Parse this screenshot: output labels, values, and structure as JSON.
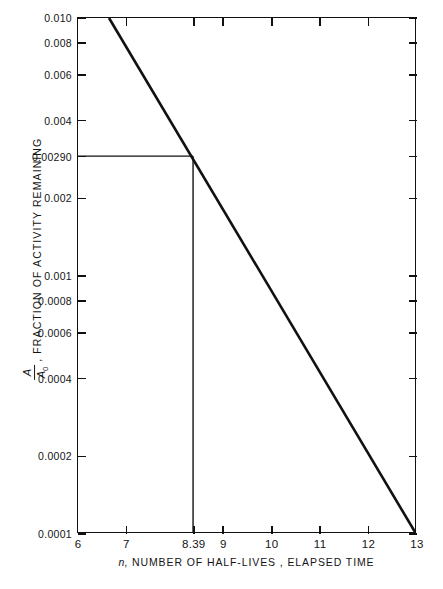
{
  "chart_data": {
    "type": "line",
    "title": "",
    "xlabel": "n , NUMBER OF HALF-LIVES , ELAPSED TIME",
    "xlabel_italic_symbol": "n",
    "xlabel_rest": ", NUMBER OF HALF-LIVES , ELAPSED TIME",
    "ylabel_prefix": "",
    "ylabel_rest": ", FRACTION OF ACTIVITY REMAINING",
    "ylabel_fraction_numerator": "A",
    "ylabel_fraction_denominator": "A",
    "ylabel_fraction_denominator_sub": "0",
    "yscale": "log",
    "xscale": "linear",
    "xlim": [
      6,
      13
    ],
    "ylim": [
      0.0001,
      0.01
    ],
    "grid": false,
    "legend": "none",
    "xticks": [
      6,
      7,
      8.39,
      9,
      10,
      11,
      12,
      13
    ],
    "xticklabels": [
      "6",
      "7",
      "8.39",
      "9",
      "10",
      "11",
      "12",
      "13"
    ],
    "yticks": [
      0.01,
      0.008,
      0.006,
      0.004,
      0.0029,
      0.002,
      0.001,
      0.0008,
      0.0006,
      0.0004,
      0.0002,
      0.0001
    ],
    "yticklabels": [
      "0.010",
      "0.008",
      "0.006",
      "0.004",
      "0.00290",
      "0.002",
      "0.001",
      "0.0008",
      "0.0006",
      "0.0004",
      "0.0002",
      "0.0001"
    ],
    "series": [
      {
        "name": "decay-curve",
        "x": [
          6.644,
          13.0
        ],
        "values": [
          0.01,
          0.0001
        ],
        "color": "#111111",
        "linewidth": 2.6
      }
    ],
    "annotations": [
      {
        "name": "readout-horizontal",
        "type": "horizontal-line",
        "y": 0.0029,
        "x_from": 6,
        "x_to": 8.39,
        "color": "#111111"
      },
      {
        "name": "readout-vertical",
        "type": "vertical-line",
        "x": 8.39,
        "y_from": 0.0001,
        "y_to": 0.0029,
        "color": "#111111"
      }
    ],
    "readout": {
      "n": "8.39",
      "fraction_remaining": "0.00290"
    }
  },
  "caption": {
    "text": ""
  }
}
